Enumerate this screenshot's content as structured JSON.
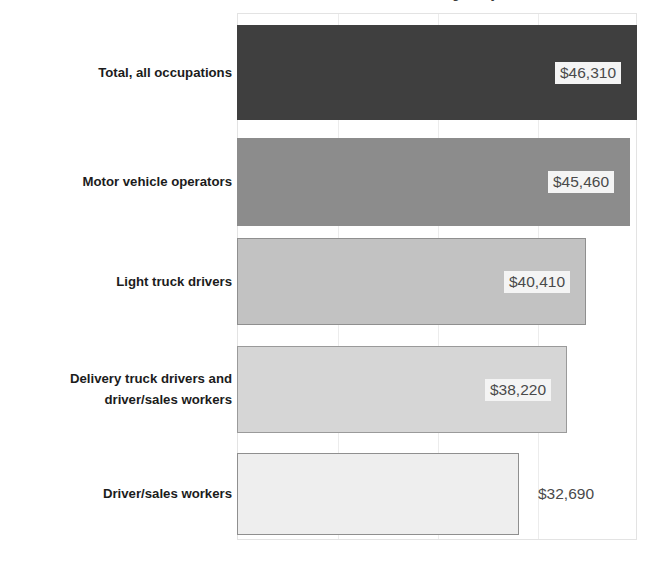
{
  "chart_data": {
    "type": "bar",
    "orientation": "horizontal",
    "title": "Median annual wage, May 2019",
    "xlabel": "",
    "ylabel": "",
    "xlim": [
      0,
      46310
    ],
    "grid": true,
    "gridlines": [
      11578,
      23155,
      34733
    ],
    "legend": null,
    "categories": [
      "Total, all occupations",
      "Motor vehicle operators",
      "Light truck drivers",
      "Delivery truck drivers and driver/sales workers",
      "Driver/sales workers"
    ],
    "values": [
      46310,
      45460,
      40410,
      38220,
      32690
    ],
    "value_labels": [
      "$46,310",
      "$45,460",
      "$40,410",
      "$38,220",
      "$32,690"
    ],
    "bar_colors": [
      "#3f3f3f",
      "#8c8c8c",
      "#c2c2c2",
      "#d6d6d6",
      "#eeeeee"
    ]
  },
  "chart": {
    "title": "Median annual wage, May 2019",
    "bars": [
      {
        "label_lines": [
          "Total, all occupations"
        ],
        "value_label": "$46,310",
        "value": 46310,
        "color": "#3f3f3f",
        "border_color": "#3f3f3f",
        "label_placement": "inside"
      },
      {
        "label_lines": [
          "Motor vehicle operators"
        ],
        "value_label": "$45,460",
        "value": 45460,
        "color": "#8c8c8c",
        "border_color": "#8c8c8c",
        "label_placement": "inside"
      },
      {
        "label_lines": [
          "Light truck drivers"
        ],
        "value_label": "$40,410",
        "value": 40410,
        "color": "#c2c2c2",
        "border_color": "#8f8f8f",
        "label_placement": "inside"
      },
      {
        "label_lines": [
          "Delivery truck drivers and",
          "driver/sales workers"
        ],
        "value_label": "$38,220",
        "value": 38220,
        "color": "#d6d6d6",
        "border_color": "#9a9a9a",
        "label_placement": "inside"
      },
      {
        "label_lines": [
          "Driver/sales workers"
        ],
        "value_label": "$32,690",
        "value": 32690,
        "color": "#eeeeee",
        "border_color": "#8f8f8f",
        "label_placement": "outside"
      }
    ]
  }
}
